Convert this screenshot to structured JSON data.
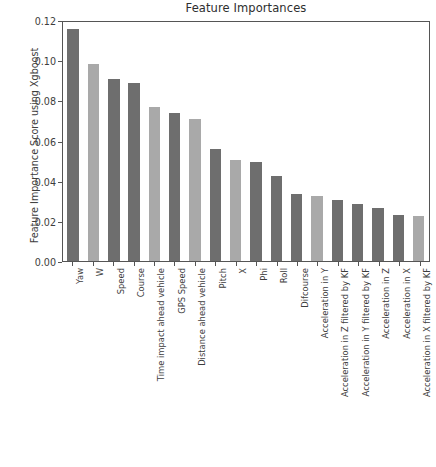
{
  "chart_data": {
    "type": "bar",
    "title": "Feature Importances",
    "xlabel": "",
    "ylabel": "Feature Importance Score using Xgboost",
    "ylim": [
      0.0,
      0.12
    ],
    "yticks": [
      "0.00",
      "0.02",
      "0.04",
      "0.06",
      "0.08",
      "0.10",
      "0.12"
    ],
    "ytick_values": [
      0.0,
      0.02,
      0.04,
      0.06,
      0.08,
      0.1,
      0.12
    ],
    "grid": false,
    "legend": "none",
    "categories": [
      "Yaw",
      "W",
      "Speed",
      "Course",
      "Time impact ahead vehicle",
      "GPS Speed",
      "Distance ahead vehicle",
      "Pitch",
      "X",
      "Phi",
      "Roll",
      "Difcourse",
      "Acceleration in Y",
      "Acceleration in Z filtered by KF",
      "Acceleration in Y filtered by KF",
      "Acceleration in Z",
      "Acceleration in X",
      "Acceleration in X filtered by KF"
    ],
    "values": [
      0.1155,
      0.098,
      0.0905,
      0.0885,
      0.0765,
      0.0735,
      0.0705,
      0.056,
      0.0505,
      0.0495,
      0.0425,
      0.0335,
      0.0325,
      0.0305,
      0.0285,
      0.0265,
      0.023,
      0.0222
    ],
    "bar_shades": [
      "dark",
      "light",
      "dark",
      "dark",
      "light",
      "dark",
      "light",
      "dark",
      "light",
      "dark",
      "dark",
      "dark",
      "light",
      "dark",
      "dark",
      "dark",
      "dark",
      "light"
    ],
    "colors": {
      "bar_dark": "#6e6e6e",
      "bar_light": "#a9a9a9",
      "axis": "#555555",
      "text": "#3d3d3d"
    }
  },
  "caption": ""
}
